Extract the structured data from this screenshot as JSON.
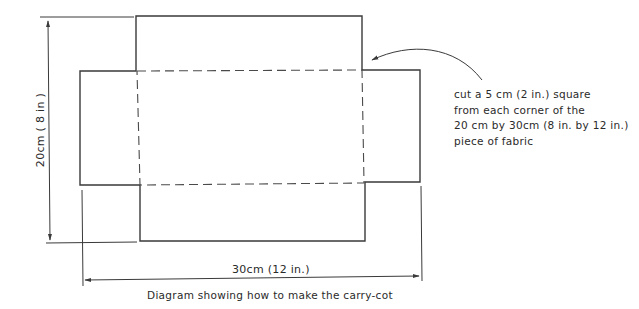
{
  "diagram": {
    "caption": "Diagram showing how to make the carry-cot",
    "height_dimension": "20cm ( 8 in )",
    "width_dimension": "30cm (12 in.)",
    "annotation": {
      "lines": [
        "cut a 5 cm (2 in.) square",
        "from each corner of the",
        "20 cm by 30cm (8 in. by 12 in.)",
        "piece of fabric"
      ]
    },
    "colors": {
      "line": "#3a3a3a",
      "background": "#ffffff"
    }
  }
}
